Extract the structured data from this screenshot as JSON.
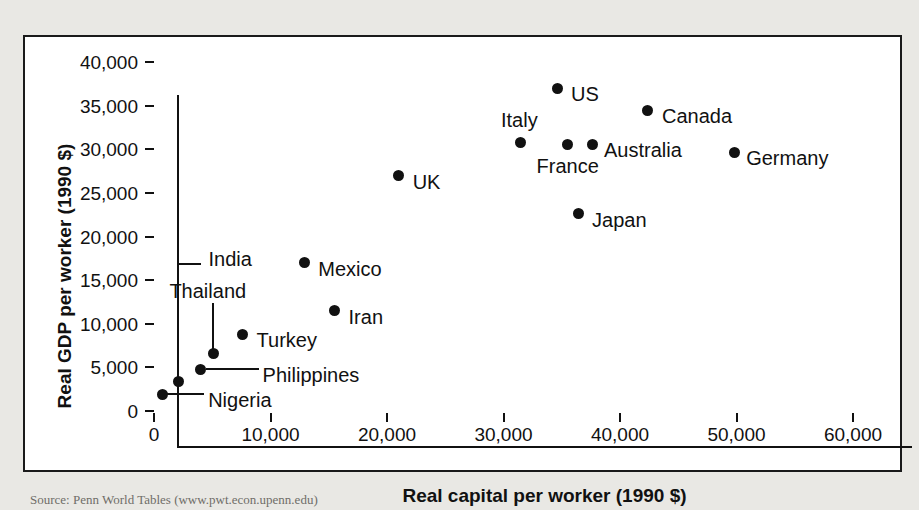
{
  "chart_data": {
    "type": "scatter",
    "title": "",
    "xlabel": "Real capital per worker (1990 $)",
    "ylabel": "Real GDP per worker (1990 $)",
    "xlim": [
      0,
      63000
    ],
    "ylim": [
      0,
      40200
    ],
    "xticks": [
      "0",
      "10,000",
      "20,000",
      "30,000",
      "40,000",
      "50,000",
      "60,000"
    ],
    "xtick_values": [
      0,
      10000,
      20000,
      30000,
      40000,
      50000,
      60000
    ],
    "yticks": [
      "0",
      "5,000",
      "10,000",
      "15,000",
      "20,000",
      "25,000",
      "30,000",
      "35,000",
      "40,000"
    ],
    "ytick_values": [
      0,
      5000,
      10000,
      15000,
      20000,
      25000,
      30000,
      35000,
      40000
    ],
    "grid": false,
    "legend": "none",
    "points": [
      {
        "label": "Nigeria",
        "x": 700,
        "y": 1900,
        "label_pos": "leader-right",
        "leader": "horizontal",
        "label_dx": 46,
        "label_dy": 6
      },
      {
        "label": "India",
        "x": 2100,
        "y": 3400,
        "label_pos": "leader-up",
        "leader": "elbow-up",
        "label_dx": 30,
        "label_dy": -122
      },
      {
        "label": "Philippines",
        "x": 4000,
        "y": 4800,
        "label_pos": "leader-right",
        "leader": "horizontal",
        "label_dx": 62,
        "label_dy": 6
      },
      {
        "label": "Thailand",
        "x": 5100,
        "y": 6600,
        "label_pos": "leader-up",
        "leader": "vertical",
        "label_dx": -44,
        "label_dy": -62
      },
      {
        "label": "Turkey",
        "x": 7600,
        "y": 8800,
        "label_pos": "right",
        "leader": "none",
        "label_dx": 14,
        "label_dy": 6
      },
      {
        "label": "Mexico",
        "x": 12900,
        "y": 17000,
        "label_pos": "right",
        "leader": "none",
        "label_dx": 14,
        "label_dy": 6
      },
      {
        "label": "Iran",
        "x": 15500,
        "y": 11500,
        "label_pos": "right",
        "leader": "none",
        "label_dx": 14,
        "label_dy": 6
      },
      {
        "label": "UK",
        "x": 21000,
        "y": 27000,
        "label_pos": "right",
        "leader": "none",
        "label_dx": 14,
        "label_dy": 6
      },
      {
        "label": "Italy",
        "x": 31500,
        "y": 30800,
        "label_pos": "above",
        "leader": "none",
        "label_dx": -20,
        "label_dy": -22
      },
      {
        "label": "US",
        "x": 34600,
        "y": 37000,
        "label_pos": "right",
        "leader": "none",
        "label_dx": 14,
        "label_dy": 6
      },
      {
        "label": "France",
        "x": 35500,
        "y": 30600,
        "label_pos": "below",
        "leader": "none",
        "label_dx": -31,
        "label_dy": 22
      },
      {
        "label": "Japan",
        "x": 36400,
        "y": 22600,
        "label_pos": "right",
        "leader": "none",
        "label_dx": 14,
        "label_dy": 6
      },
      {
        "label": "Australia",
        "x": 37600,
        "y": 30600,
        "label_pos": "right",
        "leader": "none",
        "label_dx": 12,
        "label_dy": 6
      },
      {
        "label": "Canada",
        "x": 42400,
        "y": 34500,
        "label_pos": "right",
        "leader": "none",
        "label_dx": 14,
        "label_dy": 6
      },
      {
        "label": "Germany",
        "x": 49800,
        "y": 29700,
        "label_pos": "right",
        "leader": "none",
        "label_dx": 12,
        "label_dy": 6
      }
    ]
  },
  "caption": "Source: Penn World Tables (www.pwt.econ.upenn.edu)",
  "colors": {
    "marker": "#111111",
    "axis": "#111111",
    "page_background": "#e9e8e4",
    "figure_background": "#ffffff"
  }
}
